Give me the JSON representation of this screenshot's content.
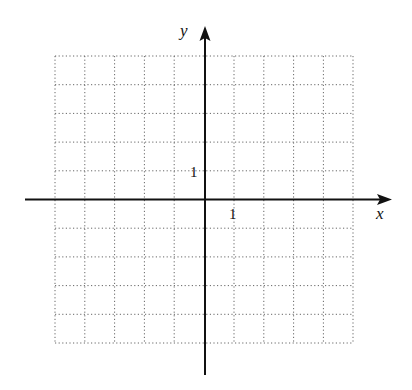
{
  "diagram": {
    "type": "coordinate-plane",
    "x_axis_label": "x",
    "y_axis_label": "y",
    "x_tick_label": "1",
    "y_tick_label": "1",
    "grid": {
      "columns": 10,
      "rows": 10,
      "style": "dotted"
    },
    "colors": {
      "axis": "#111111",
      "grid": "#555555",
      "background": "#ffffff"
    }
  }
}
